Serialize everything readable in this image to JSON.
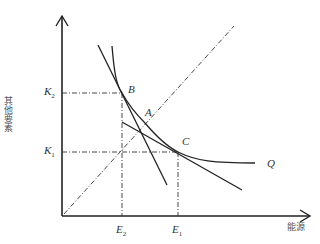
{
  "diagram": {
    "type": "isoquant-substitution",
    "axes": {
      "x_label": "能源",
      "y_label": "其他要素"
    },
    "ticks": {
      "y": [
        {
          "name": "K",
          "sub": "2"
        },
        {
          "name": "K",
          "sub": "1"
        }
      ],
      "x": [
        {
          "name": "E",
          "sub": "2"
        },
        {
          "name": "E",
          "sub": "1"
        }
      ]
    },
    "points": [
      {
        "name": "B"
      },
      {
        "name": "A"
      },
      {
        "name": "C"
      }
    ],
    "curve_label": "Q",
    "colors": {
      "line": "#222222",
      "text": "#333333"
    }
  }
}
